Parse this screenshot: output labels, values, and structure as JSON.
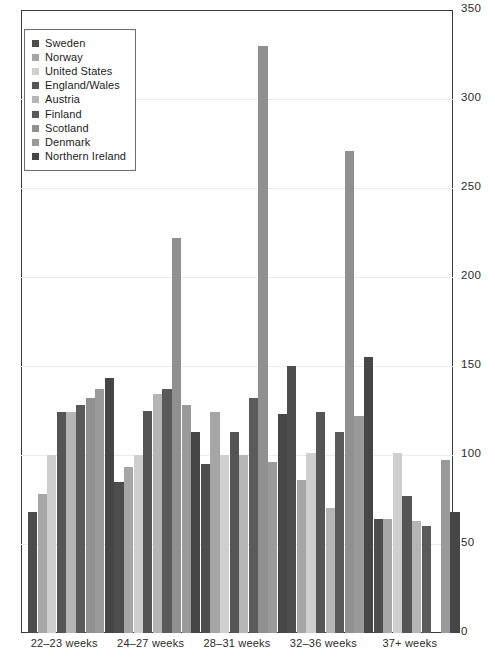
{
  "chart_data": {
    "type": "bar",
    "title": "",
    "xlabel": "",
    "ylabel": "",
    "ylim": [
      0,
      350
    ],
    "ytick_values": [
      0,
      50,
      100,
      150,
      200,
      250,
      300,
      350
    ],
    "ytick_labels": [
      "0",
      "50",
      "100",
      "150",
      "200",
      "250",
      "300",
      "350"
    ],
    "grid": true,
    "legend_position": "top-left",
    "categories": [
      "22–23 weeks",
      "24–27 weeks",
      "28–31 weeks",
      "32–36 weeks",
      "37+ weeks"
    ],
    "series": [
      {
        "name": "Sweden",
        "color": "#4d4d4d",
        "values": [
          68,
          85,
          95,
          150,
          64
        ]
      },
      {
        "name": "Norway",
        "color": "#a6a6a6",
        "values": [
          78,
          93,
          124,
          86,
          64
        ]
      },
      {
        "name": "United States",
        "color": "#cfcfcf",
        "values": [
          100,
          100,
          100,
          101,
          101
        ]
      },
      {
        "name": "England/Wales",
        "color": "#555555",
        "values": [
          124,
          125,
          113,
          124,
          77
        ]
      },
      {
        "name": "Austria",
        "color": "#b5b5b5",
        "values": [
          124,
          134,
          100,
          70,
          63
        ]
      },
      {
        "name": "Finland",
        "color": "#5a5a5a",
        "values": [
          128,
          137,
          132,
          113,
          60
        ]
      },
      {
        "name": "Scotland",
        "color": "#909090",
        "values": [
          132,
          222,
          330,
          271,
          null
        ]
      },
      {
        "name": "Denmark",
        "color": "#9a9a9a",
        "values": [
          137,
          128,
          96,
          122,
          97
        ]
      },
      {
        "name": "Northern Ireland",
        "color": "#464646",
        "values": [
          143,
          113,
          123,
          155,
          68
        ]
      }
    ]
  },
  "legend": {
    "items": [
      {
        "label": "Sweden"
      },
      {
        "label": "Norway"
      },
      {
        "label": "United States"
      },
      {
        "label": "England/Wales"
      },
      {
        "label": "Austria"
      },
      {
        "label": "Finland"
      },
      {
        "label": "Scotland"
      },
      {
        "label": "Denmark"
      },
      {
        "label": "Northern Ireland"
      }
    ]
  },
  "axis": {
    "y_labels": [
      "350",
      "300",
      "250",
      "200",
      "150",
      "100",
      "50",
      "0"
    ],
    "x_labels": [
      "22–23 weeks",
      "24–27 weeks",
      "28–31 weeks",
      "32–36 weeks",
      "37+ weeks"
    ]
  }
}
